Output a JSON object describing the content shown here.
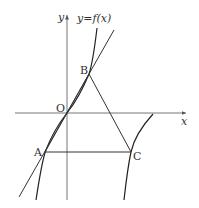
{
  "diagram": {
    "function_label": "y=f(x)",
    "axes": {
      "x_label": "x",
      "y_label": "y",
      "origin_label": "O"
    },
    "points": {
      "A": {
        "label": "A"
      },
      "B": {
        "label": "B"
      },
      "C": {
        "label": "C"
      }
    },
    "colors": {
      "stroke": "#333333",
      "axis": "#555555",
      "background": "#ffffff"
    }
  }
}
